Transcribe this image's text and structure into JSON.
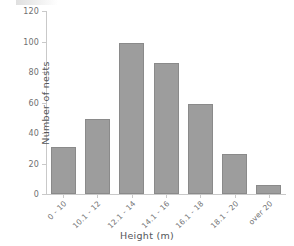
{
  "chart_data": {
    "type": "bar",
    "title": "",
    "xlabel": "Height (m)",
    "ylabel": "Number of nests",
    "categories": [
      "0 - 10",
      "10.1 - 12",
      "12.1 - 14",
      "14.1 - 16",
      "16.1 - 18",
      "18.1 - 20",
      "over 20"
    ],
    "values": [
      31,
      49,
      99,
      86,
      59,
      26,
      6
    ],
    "ylim": [
      0,
      120
    ],
    "yticks": [
      0,
      20,
      40,
      60,
      80,
      100,
      120
    ],
    "ytick_labels": [
      "0",
      "20",
      "40",
      "60",
      "80",
      "100",
      "120"
    ],
    "grid": false,
    "legend": "none",
    "bar_color": "#9d9d9d",
    "bar_border_color": "#8a8a8a",
    "axis_color": "#c9c9c9",
    "text_color": "#6f6f71",
    "background": "#ffffff"
  }
}
